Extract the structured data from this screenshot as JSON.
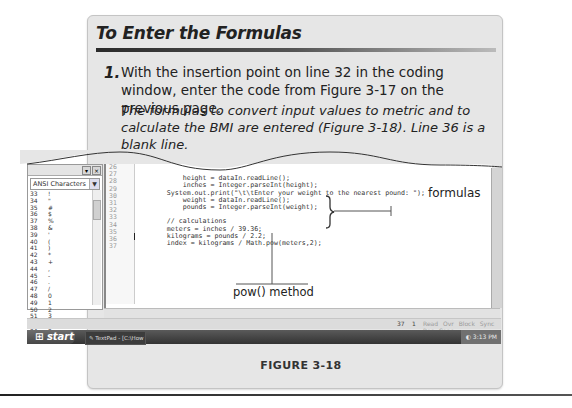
{
  "panel": {
    "title": "To Enter the Formulas",
    "step_number": "1.",
    "step_text": "With the insertion point on line 32 in the coding window, enter the code from Figure 3-17 on the previous page.",
    "step_result": "The formulas to convert input values to metric and to calculate the BMI are entered (Figure 3-18). Line 36 is a blank line."
  },
  "ansi_panel": {
    "header_dropdown": "ANSI Characters",
    "rows": [
      {
        "code": "33",
        "char": "!"
      },
      {
        "code": "34",
        "char": "\""
      },
      {
        "code": "35",
        "char": "#"
      },
      {
        "code": "36",
        "char": "$"
      },
      {
        "code": "37",
        "char": "%"
      },
      {
        "code": "38",
        "char": "&"
      },
      {
        "code": "39",
        "char": "'"
      },
      {
        "code": "40",
        "char": "("
      },
      {
        "code": "41",
        "char": ")"
      },
      {
        "code": "42",
        "char": "*"
      },
      {
        "code": "43",
        "char": "+"
      },
      {
        "code": "44",
        "char": ","
      },
      {
        "code": "45",
        "char": "-"
      },
      {
        "code": "46",
        "char": "."
      },
      {
        "code": "47",
        "char": "/"
      },
      {
        "code": "48",
        "char": "0"
      },
      {
        "code": "49",
        "char": "1"
      },
      {
        "code": "50",
        "char": "2"
      },
      {
        "code": "51",
        "char": "3"
      },
      {
        "code": "52",
        "char": "4"
      },
      {
        "code": "53",
        "char": "5"
      }
    ]
  },
  "editor": {
    "line_numbers": [
      "26",
      "27",
      "28",
      "29",
      "30",
      "31",
      "32",
      "33",
      "34",
      "35",
      "36",
      "37"
    ],
    "lines": [
      "          height = dataIn.readLine();",
      "          inches = Integer.parseInt(height);",
      "      System.out.print(\"\\t\\tEnter your weight to the nearest pound: \");",
      "          weight = dataIn.readLine();",
      "          pounds = Integer.parseInt(weight);",
      "",
      "      // calculations",
      "      meters = inches / 39.36;",
      "      kilograms = pounds / 2.2;",
      "      index = kilograms / Math.pow(meters,2);",
      "",
      ""
    ]
  },
  "status_bar": {
    "line": "37",
    "column": "1",
    "flags": "Read Ovr Block Sync Rec Caps"
  },
  "taskbar": {
    "start_label": "start",
    "task_item": "TextPad - [C:\\How To...",
    "clock": "3:13 PM"
  },
  "callouts": {
    "formulas": "formulas",
    "pow_method": "pow() method"
  },
  "figure_caption": "FIGURE 3-18"
}
